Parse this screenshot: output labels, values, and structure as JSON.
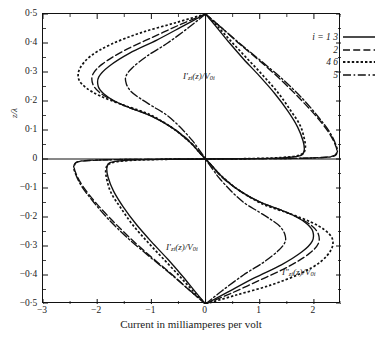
{
  "chart_data": {
    "type": "line",
    "title": "",
    "xlabel": "Current in milliamperes per volt",
    "ylabel": "z/λ",
    "xlim": [
      -3,
      2.5
    ],
    "ylim": [
      -0.5,
      0.5
    ],
    "xticks": [
      -3,
      -2,
      -1,
      0,
      1,
      2
    ],
    "xticklabels": [
      "−3",
      "−2",
      "−1",
      "0",
      "1",
      "2"
    ],
    "yticks": [
      0.5,
      0.4,
      0.3,
      0.2,
      0.1,
      0,
      -0.1,
      -0.2,
      -0.3,
      -0.4,
      -0.5
    ],
    "yticklabels": [
      "0·5",
      "0·4",
      "0·3",
      "0·2",
      "0·1",
      "0",
      "−0·1",
      "−0·2",
      "−0·3",
      "−0·4",
      "−0·5"
    ],
    "grid": false,
    "minor_ticks": true,
    "legend_position": "top-right",
    "annotations": [
      {
        "id": "annot-1",
        "text_html": "I′<span class='sub'>zi</span>(z)/V<span class='sub'>0i</span>",
        "x": -0.85,
        "y": 0.335
      },
      {
        "id": "annot-2",
        "text_html": "I′<span class='sub'>zi</span>(z)/V<span class='sub'>0i</span>",
        "x": -1.15,
        "y": -0.275
      },
      {
        "id": "annot-3",
        "text_html": "I″<span class='sub'>zi</span>(z)/V<span class='sub'>0i</span>",
        "x": 0.95,
        "y": -0.33
      }
    ],
    "series": [
      {
        "name": "i = 1  3",
        "style": "solid",
        "label_html": "i = 1 3",
        "upper_peak_x": -1.95,
        "upper_peak_y": 0.285,
        "lower_peak_x": 1.8,
        "lower_peak_y": 0.04
      },
      {
        "name": "2",
        "style": "dashed",
        "label_html": "2",
        "upper_peak_x": -2.05,
        "upper_peak_y": 0.3,
        "lower_peak_x": 2.4,
        "lower_peak_y": 0.025
      },
      {
        "name": "4  6",
        "style": "dotted",
        "label_html": "4 6",
        "upper_peak_x": -2.35,
        "upper_peak_y": 0.31,
        "lower_peak_x": 1.8,
        "lower_peak_y": 0.055
      },
      {
        "name": "5",
        "style": "dashdot",
        "label_html": "5",
        "upper_peak_x": -1.45,
        "upper_peak_y": 0.295,
        "lower_peak_x": 2.4,
        "lower_peak_y": 0.03
      }
    ],
    "curves_left": [
      {
        "series": "4 6",
        "style": "dotted",
        "points": [
          [
            0,
            0.5
          ],
          [
            -0.55,
            0.47
          ],
          [
            -1.2,
            0.435
          ],
          [
            -1.75,
            0.395
          ],
          [
            -2.12,
            0.355
          ],
          [
            -2.32,
            0.312
          ],
          [
            -2.34,
            0.275
          ],
          [
            -2.2,
            0.245
          ],
          [
            -1.95,
            0.218
          ],
          [
            -1.55,
            0.188
          ],
          [
            -1.05,
            0.155
          ],
          [
            -0.62,
            0.108
          ],
          [
            -0.3,
            0.06
          ],
          [
            -0.1,
            0.02
          ],
          [
            0,
            0
          ]
        ]
      },
      {
        "series": "1 3",
        "style": "solid",
        "points": [
          [
            0,
            0.5
          ],
          [
            -0.4,
            0.46
          ],
          [
            -0.9,
            0.41
          ],
          [
            -1.4,
            0.365
          ],
          [
            -1.78,
            0.32
          ],
          [
            -1.97,
            0.283
          ],
          [
            -1.98,
            0.25
          ],
          [
            -1.88,
            0.225
          ],
          [
            -1.68,
            0.2
          ],
          [
            -1.38,
            0.175
          ],
          [
            -1.0,
            0.148
          ],
          [
            -0.62,
            0.108
          ],
          [
            -0.3,
            0.06
          ],
          [
            -0.1,
            0.02
          ],
          [
            0,
            0
          ]
        ]
      },
      {
        "series": "2",
        "style": "dashed",
        "points": [
          [
            0,
            0.5
          ],
          [
            -0.45,
            0.465
          ],
          [
            -1.0,
            0.418
          ],
          [
            -1.52,
            0.372
          ],
          [
            -1.9,
            0.328
          ],
          [
            -2.08,
            0.292
          ],
          [
            -2.08,
            0.258
          ],
          [
            -1.96,
            0.23
          ],
          [
            -1.74,
            0.205
          ],
          [
            -1.42,
            0.178
          ],
          [
            -1.02,
            0.15
          ],
          [
            -0.63,
            0.11
          ],
          [
            -0.3,
            0.062
          ],
          [
            -0.1,
            0.02
          ],
          [
            0,
            0
          ]
        ]
      },
      {
        "series": "5",
        "style": "dashdot",
        "points": [
          [
            0,
            0.5
          ],
          [
            -0.3,
            0.455
          ],
          [
            -0.7,
            0.4
          ],
          [
            -1.08,
            0.355
          ],
          [
            -1.35,
            0.315
          ],
          [
            -1.47,
            0.285
          ],
          [
            -1.46,
            0.258
          ],
          [
            -1.37,
            0.232
          ],
          [
            -1.2,
            0.208
          ],
          [
            -0.98,
            0.182
          ],
          [
            -0.72,
            0.152
          ],
          [
            -0.48,
            0.112
          ],
          [
            -0.25,
            0.065
          ],
          [
            -0.08,
            0.022
          ],
          [
            0,
            0
          ]
        ]
      }
    ],
    "curves_right": [
      {
        "series": "1 3",
        "style": "solid",
        "points": [
          [
            0,
            0.5
          ],
          [
            0.18,
            0.46
          ],
          [
            0.42,
            0.405
          ],
          [
            0.7,
            0.345
          ],
          [
            1.0,
            0.285
          ],
          [
            1.28,
            0.225
          ],
          [
            1.52,
            0.165
          ],
          [
            1.7,
            0.11
          ],
          [
            1.8,
            0.062
          ],
          [
            1.82,
            0.03
          ],
          [
            1.75,
            0.012
          ],
          [
            1.4,
            0.004
          ],
          [
            0.7,
            0.001
          ],
          [
            0,
            0
          ]
        ]
      },
      {
        "series": "4 6",
        "style": "dotted",
        "points": [
          [
            0,
            0.5
          ],
          [
            0.2,
            0.462
          ],
          [
            0.46,
            0.408
          ],
          [
            0.76,
            0.348
          ],
          [
            1.06,
            0.288
          ],
          [
            1.34,
            0.228
          ],
          [
            1.56,
            0.17
          ],
          [
            1.74,
            0.118
          ],
          [
            1.82,
            0.072
          ],
          [
            1.84,
            0.038
          ],
          [
            1.76,
            0.015
          ],
          [
            1.4,
            0.005
          ],
          [
            0.7,
            0.001
          ],
          [
            0,
            0
          ]
        ]
      },
      {
        "series": "2",
        "style": "dashed",
        "points": [
          [
            0,
            0.5
          ],
          [
            0.28,
            0.455
          ],
          [
            0.62,
            0.398
          ],
          [
            1.0,
            0.338
          ],
          [
            1.38,
            0.275
          ],
          [
            1.72,
            0.212
          ],
          [
            2.02,
            0.152
          ],
          [
            2.25,
            0.098
          ],
          [
            2.38,
            0.055
          ],
          [
            2.42,
            0.026
          ],
          [
            2.3,
            0.008
          ],
          [
            1.6,
            0.002
          ],
          [
            0.7,
            0.001
          ],
          [
            0,
            0
          ]
        ]
      },
      {
        "series": "5",
        "style": "dashdot",
        "points": [
          [
            0,
            0.5
          ],
          [
            0.3,
            0.452
          ],
          [
            0.66,
            0.394
          ],
          [
            1.05,
            0.334
          ],
          [
            1.44,
            0.272
          ],
          [
            1.78,
            0.21
          ],
          [
            2.06,
            0.15
          ],
          [
            2.28,
            0.096
          ],
          [
            2.4,
            0.052
          ],
          [
            2.43,
            0.024
          ],
          [
            2.3,
            0.007
          ],
          [
            1.6,
            0.002
          ],
          [
            0.7,
            0.001
          ],
          [
            0,
            0
          ]
        ]
      }
    ]
  },
  "legend": {
    "rows": [
      {
        "label": "i = 1 3",
        "style": "solid"
      },
      {
        "label": "2",
        "style": "dashed"
      },
      {
        "label": "4 6",
        "style": "dotted"
      },
      {
        "label": "5",
        "style": "dashdot"
      }
    ]
  },
  "colors": {
    "line": "#111111",
    "axis": "#111111",
    "background": "#ffffff"
  }
}
